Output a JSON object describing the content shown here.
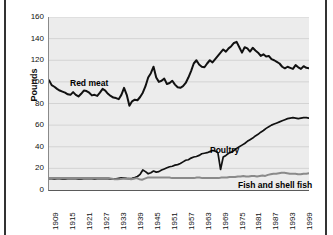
{
  "frame": {
    "left_rule": "vertical-rule",
    "right_rule": "vertical-rule"
  },
  "chart_data": {
    "type": "line",
    "title": "",
    "subtitle": "",
    "xlabel": "",
    "ylabel": "Pounds",
    "grid": true,
    "legend_position": "inline-annotations",
    "xlim": [
      1909,
      2001
    ],
    "ylim": [
      0,
      160
    ],
    "ytick_labels": [
      "0",
      "20",
      "40",
      "60",
      "80",
      "100",
      "120",
      "140",
      "160"
    ],
    "ytick_values": [
      0,
      20,
      40,
      60,
      80,
      100,
      120,
      140,
      160
    ],
    "xtick_labels": [
      "1909",
      "1915",
      "1921",
      "1927",
      "1933",
      "1939",
      "1945",
      "1951",
      "1957",
      "1963",
      "1969",
      "1975",
      "1981",
      "1987",
      "1993",
      "1999"
    ],
    "xtick_values": [
      1909,
      1915,
      1921,
      1927,
      1933,
      1939,
      1945,
      1951,
      1957,
      1963,
      1969,
      1975,
      1981,
      1987,
      1993,
      1999
    ],
    "x_start": 1909,
    "x_end": 2001,
    "annotations": [
      {
        "name": "red-meat",
        "text": "Red meat"
      },
      {
        "name": "poultry",
        "text": "Poultry"
      },
      {
        "name": "fish-and-shell-fish",
        "text": "Fish and shell fish"
      }
    ],
    "series": [
      {
        "name": "Red meat",
        "color": "#111111",
        "width": 2.0,
        "values": [
          101.5,
          97.0,
          95.5,
          93.5,
          92.0,
          91.0,
          90.0,
          88.5,
          88.0,
          90.5,
          88.0,
          86.5,
          89.0,
          92.0,
          91.5,
          90.0,
          87.5,
          88.0,
          87.0,
          90.0,
          93.5,
          92.0,
          89.0,
          87.0,
          85.5,
          85.0,
          84.0,
          88.0,
          94.5,
          88.0,
          78.0,
          82.0,
          83.5,
          83.0,
          86.0,
          90.0,
          96.0,
          104.0,
          108.0,
          114.0,
          104.0,
          100.0,
          101.0,
          103.0,
          98.0,
          99.0,
          101.0,
          97.5,
          95.0,
          94.5,
          96.0,
          99.0,
          104.0,
          110.0,
          117.0,
          120.0,
          116.0,
          114.0,
          113.5,
          117.0,
          120.0,
          118.0,
          121.0,
          124.0,
          127.0,
          130.0,
          128.0,
          131.0,
          133.0,
          136.0,
          137.0,
          132.0,
          127.0,
          132.0,
          131.0,
          128.0,
          131.5,
          129.0,
          127.0,
          124.0,
          125.5,
          123.5,
          124.0,
          121.0,
          120.0,
          118.5,
          117.0,
          114.0,
          112.5,
          114.0,
          113.0,
          112.0,
          115.5,
          113.5,
          112.0,
          114.5,
          113.0,
          112.5
        ]
      },
      {
        "name": "Poultry",
        "color": "#111111",
        "width": 1.7,
        "values": [
          10.5,
          10.4,
          10.3,
          10.5,
          10.4,
          10.2,
          10.3,
          10.5,
          10.6,
          10.5,
          10.4,
          10.3,
          10.2,
          10.4,
          10.6,
          10.5,
          10.4,
          10.3,
          10.5,
          10.6,
          10.5,
          10.4,
          10.5,
          10.3,
          10.2,
          10.4,
          10.8,
          11.2,
          11.0,
          10.7,
          10.5,
          10.8,
          11.5,
          12.5,
          14.5,
          18.5,
          17.0,
          15.0,
          16.0,
          17.5,
          16.5,
          17.0,
          18.5,
          19.5,
          20.5,
          21.5,
          22.0,
          23.0,
          23.5,
          24.5,
          26.0,
          27.5,
          28.0,
          29.5,
          30.5,
          31.0,
          32.0,
          33.5,
          34.0,
          34.5,
          35.5,
          36.5,
          36.0,
          34.5,
          19.0,
          30.5,
          32.0,
          34.0,
          35.0,
          36.5,
          38.5,
          40.0,
          41.5,
          43.0,
          45.0,
          46.5,
          48.0,
          50.0,
          51.5,
          53.5,
          55.0,
          57.0,
          58.5,
          60.0,
          61.0,
          62.0,
          63.0,
          64.0,
          65.0,
          66.0,
          66.5,
          67.0,
          66.5,
          66.0,
          66.5,
          67.0,
          67.0,
          66.5
        ]
      },
      {
        "name": "Fish and shell fish",
        "color": "#8a8a8a",
        "width": 2.0,
        "values": [
          11.0,
          11.0,
          11.0,
          11.0,
          11.0,
          11.0,
          11.0,
          11.0,
          11.0,
          11.0,
          11.0,
          11.0,
          11.0,
          11.0,
          11.0,
          11.2,
          11.0,
          11.0,
          11.0,
          11.0,
          11.0,
          11.2,
          11.0,
          10.5,
          10.0,
          10.0,
          10.2,
          10.5,
          10.5,
          10.5,
          10.0,
          10.5,
          11.0,
          10.0,
          9.5,
          10.5,
          11.5,
          11.5,
          11.5,
          11.5,
          11.5,
          11.5,
          11.5,
          11.5,
          11.5,
          11.0,
          11.0,
          11.0,
          11.0,
          11.0,
          11.0,
          11.0,
          11.0,
          11.0,
          11.5,
          11.5,
          11.0,
          11.0,
          11.0,
          11.0,
          11.0,
          11.0,
          11.0,
          11.5,
          11.5,
          11.5,
          12.0,
          12.0,
          12.0,
          12.5,
          12.5,
          13.0,
          12.5,
          12.5,
          13.0,
          13.0,
          12.5,
          13.0,
          13.5,
          13.0,
          14.0,
          14.5,
          15.0,
          15.0,
          15.5,
          16.0,
          16.0,
          15.5,
          15.0,
          15.0,
          15.0,
          14.5,
          14.5,
          15.0,
          15.0,
          15.5
        ]
      }
    ]
  }
}
